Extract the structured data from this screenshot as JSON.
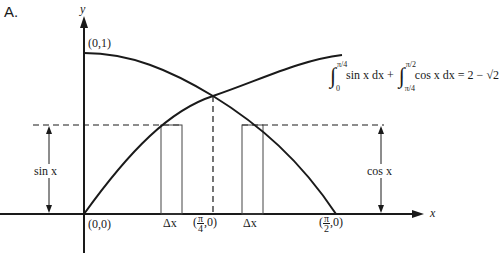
{
  "panel_label": "A.",
  "axes": {
    "x_label": "x",
    "y_label": "y"
  },
  "points": {
    "top": "(0,1)",
    "origin": "(0,0)",
    "quarter_pi_prefix": "(",
    "quarter_pi_num": "π",
    "quarter_pi_den": "4",
    "quarter_pi_suffix": ",0)",
    "half_pi_prefix": "(",
    "half_pi_num": "π",
    "half_pi_den": "2",
    "half_pi_suffix": ",0)"
  },
  "delta_labels": [
    "Δx",
    "Δx"
  ],
  "brackets": {
    "left": "sin x",
    "right": "cos x"
  },
  "equation": {
    "int1_upper": "π/4",
    "int1_lower": "0",
    "int1_body": "sin x dx +",
    "int2_upper": "π/2",
    "int2_lower": "π/4",
    "int2_body": "cos x dx = 2 − √2"
  },
  "curves": [
    {
      "name": "sin x",
      "domain": "0 to π/2"
    },
    {
      "name": "cos x",
      "domain": "0 to π/2"
    }
  ],
  "colors": {
    "ink": "#1a1a1a",
    "background": "#ffffff"
  }
}
